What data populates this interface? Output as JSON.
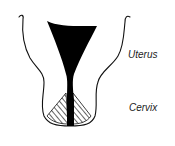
{
  "diagram": {
    "type": "anatomical-cross-section",
    "labels": [
      {
        "id": "uterus",
        "text": "Uterus"
      },
      {
        "id": "cervix",
        "text": "Cervix"
      }
    ],
    "colors": {
      "background": "#ffffff",
      "outline": "#111111",
      "cavity_fill": "#000000",
      "cervix_hatch": "#111111",
      "label_text": "#222222"
    }
  }
}
